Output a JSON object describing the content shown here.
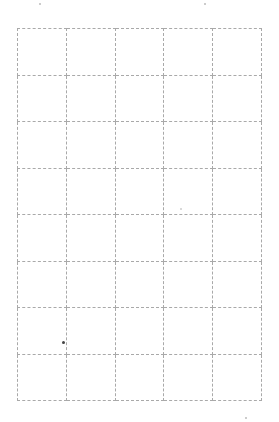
{
  "page": {
    "type": "blank dashed grid sheet",
    "top_fragment_text": "",
    "line_color": "#a9a9a9",
    "background_color": "#ffffff"
  },
  "grid": {
    "columns": 5,
    "rows": 8,
    "cells": [
      [
        "",
        "",
        "",
        "",
        ""
      ],
      [
        "",
        "",
        "",
        "",
        ""
      ],
      [
        "",
        "",
        "",
        "",
        ""
      ],
      [
        "",
        "",
        "",
        "",
        ""
      ],
      [
        "",
        "",
        "",
        "",
        ""
      ],
      [
        "",
        "",
        "",
        "",
        ""
      ],
      [
        "",
        "",
        "",
        "",
        ""
      ],
      [
        "",
        "",
        "",
        "",
        ""
      ]
    ]
  },
  "marks": [
    {
      "x": 63,
      "y": 342,
      "size": 3,
      "color": "#444444"
    },
    {
      "x": 205,
      "y": 4,
      "size": 2,
      "color": "#bbbbbb"
    },
    {
      "x": 40,
      "y": 4,
      "size": 2,
      "color": "#bbbbbb"
    },
    {
      "x": 246,
      "y": 418,
      "size": 2,
      "color": "#bbbbbb"
    },
    {
      "x": 181,
      "y": 209,
      "size": 2,
      "color": "#cccccc"
    }
  ]
}
